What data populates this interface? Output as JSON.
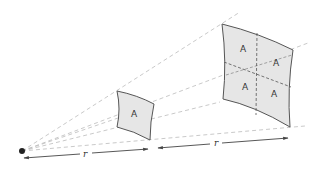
{
  "diagram": {
    "type": "inverse-square-law",
    "colors": {
      "background": "#ffffff",
      "patch_fill": "#e6e6e6",
      "patch_stroke": "#555555",
      "ray_stroke": "#bbbbbb",
      "arrow_stroke": "#444444",
      "source_dot": "#222222"
    },
    "source": {
      "label": ""
    },
    "near_patch": {
      "cells": [
        "A"
      ]
    },
    "far_patch": {
      "cells": [
        "A",
        "A",
        "A",
        "A"
      ]
    },
    "distances": [
      {
        "label": "r"
      },
      {
        "label": "r"
      }
    ]
  }
}
